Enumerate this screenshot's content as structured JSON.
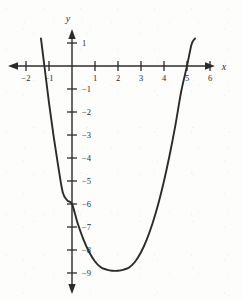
{
  "figure": {
    "background_color": "#fdfdfc",
    "ink_color": "#2b2b2b"
  },
  "axes": {
    "x_axis_label": "x",
    "y_axis_label": "y",
    "x_ticks": [
      {
        "value": -2,
        "label": "−2"
      },
      {
        "value": -1,
        "label": "−1"
      },
      {
        "value": 1,
        "label": "1"
      },
      {
        "value": 2,
        "label": "2"
      },
      {
        "value": 3,
        "label": "3"
      },
      {
        "value": 4,
        "label": "4"
      },
      {
        "value": 5,
        "label": "5"
      },
      {
        "value": 6,
        "label": "6"
      }
    ],
    "y_ticks": [
      {
        "value": 1,
        "label": "1"
      },
      {
        "value": -1,
        "label": "−1"
      },
      {
        "value": -2,
        "label": "−2"
      },
      {
        "value": -3,
        "label": "−3"
      },
      {
        "value": -4,
        "label": "−4"
      },
      {
        "value": -5,
        "label": "−5"
      },
      {
        "value": -6,
        "label": "−6"
      },
      {
        "value": -7,
        "label": "−7"
      },
      {
        "value": -8,
        "label": "−8"
      },
      {
        "value": -9,
        "label": "−9"
      }
    ]
  },
  "chart_data": {
    "type": "line",
    "title": "",
    "subtitle": "",
    "xlabel": "x",
    "ylabel": "y",
    "xlim": [
      -2.7,
      6.9
    ],
    "ylim": [
      -9.9,
      1.6
    ],
    "grid": false,
    "legend": null,
    "annotations": [],
    "curve": {
      "name": "parabola",
      "shape": "upward-opening parabola",
      "x_intercepts": [
        -1,
        5
      ],
      "y_intercept": -6,
      "vertex": [
        2,
        -8.9
      ],
      "axis_of_symmetry": 2,
      "x": [
        -1.35,
        -1.2,
        -1.0,
        -0.8,
        -0.6,
        -0.4,
        -0.2,
        0.0,
        0.25,
        0.5,
        0.75,
        1.0,
        1.25,
        1.5,
        1.75,
        2.0,
        2.25,
        2.5,
        2.75,
        3.0,
        3.25,
        3.5,
        3.75,
        4.0,
        4.25,
        4.5,
        4.75,
        5.0,
        5.2,
        5.35
      ],
      "y": [
        1.2,
        0.0,
        -1.6,
        -3.05,
        -4.35,
        -5.5,
        -5.85,
        -6.0,
        -6.85,
        -7.55,
        -8.1,
        -8.5,
        -8.75,
        -8.85,
        -8.9,
        -8.9,
        -8.85,
        -8.75,
        -8.5,
        -8.1,
        -7.55,
        -6.85,
        -6.0,
        -5.0,
        -3.85,
        -2.55,
        -1.1,
        0.0,
        0.95,
        1.2
      ]
    }
  }
}
